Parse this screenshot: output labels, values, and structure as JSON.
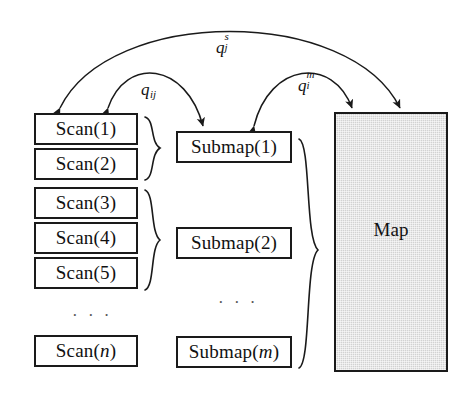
{
  "figure": {
    "background_color": "#ffffff",
    "stroke_color": "#1a1a1a",
    "map_fill_color": "#d2d2d2"
  },
  "scan_column": {
    "name": "scan-column",
    "boxes": [
      {
        "label": "Scan(1)",
        "x": 34,
        "y": 113,
        "w": 104,
        "h": 32
      },
      {
        "label": "Scan(2)",
        "x": 34,
        "y": 148,
        "w": 104,
        "h": 32
      },
      {
        "label": "Scan(3)",
        "x": 34,
        "y": 187,
        "w": 104,
        "h": 32
      },
      {
        "label": "Scan(4)",
        "x": 34,
        "y": 222,
        "w": 104,
        "h": 32
      },
      {
        "label": "Scan(5)",
        "x": 34,
        "y": 257,
        "w": 104,
        "h": 32
      },
      {
        "label": "Scan(n)",
        "x": 34,
        "y": 335,
        "w": 104,
        "h": 32
      }
    ],
    "ellipsis": "· · ·"
  },
  "submap_column": {
    "name": "submap-column",
    "boxes": [
      {
        "label": "Submap(1)",
        "x": 176,
        "y": 131,
        "w": 116,
        "h": 32
      },
      {
        "label": "Submap(2)",
        "x": 176,
        "y": 227,
        "w": 116,
        "h": 32
      },
      {
        "label": "Submap(m)",
        "x": 176,
        "y": 336,
        "w": 116,
        "h": 32
      }
    ],
    "ellipsis": "· · ·"
  },
  "map_node": {
    "label": "Map",
    "x": 334,
    "y": 112,
    "w": 114,
    "h": 260
  },
  "braces": [
    {
      "name": "brace-scan-1-2",
      "top": 116,
      "bottom": 181,
      "x": 144,
      "tip_x": 161
    },
    {
      "name": "brace-scan-3-5",
      "top": 189,
      "bottom": 291,
      "x": 144,
      "tip_x": 161
    },
    {
      "name": "brace-submaps",
      "top": 138,
      "bottom": 369,
      "x": 298,
      "tip_x": 319
    }
  ],
  "arcs": [
    {
      "name": "arc-scan-to-map",
      "label_base": "q",
      "label_sup": "s",
      "label_sub": "j",
      "label_x": 216,
      "label_y": 36,
      "from": "Scan(1)",
      "to": "Map",
      "start_x": 58,
      "start_y": 110,
      "end_x": 402,
      "end_y": 110,
      "peak_y": 26
    },
    {
      "name": "arc-scan-to-submap",
      "label_base": "q",
      "label_sup": "",
      "label_sub": "ij",
      "label_x": 144,
      "label_y": 80,
      "from": "Scan(1)",
      "to": "Submap(1)",
      "start_x": 106,
      "start_y": 110,
      "end_x": 203,
      "end_y": 128,
      "peak_y": 72
    },
    {
      "name": "arc-submap-to-map",
      "label_base": "q",
      "label_sup": "m",
      "label_sub": "i",
      "label_x": 300,
      "label_y": 76,
      "from": "Submap(1)",
      "to": "Map",
      "start_x": 254,
      "start_y": 128,
      "end_x": 354,
      "end_y": 110,
      "peak_y": 72
    }
  ]
}
